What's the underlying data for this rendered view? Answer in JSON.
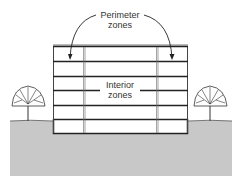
{
  "diagram": {
    "labels": {
      "perimeter_line1": "Perimeter",
      "perimeter_line2": "zones",
      "interior_line1": "Interior",
      "interior_line2": "zones"
    },
    "building": {
      "floors": 6,
      "below_grade_levels": 1,
      "zones": [
        "perimeter-left",
        "interior",
        "perimeter-right"
      ]
    },
    "colors": {
      "ground": "#c8c8c8",
      "lines": "#222222",
      "text": "#333333",
      "background": "#ffffff"
    }
  }
}
